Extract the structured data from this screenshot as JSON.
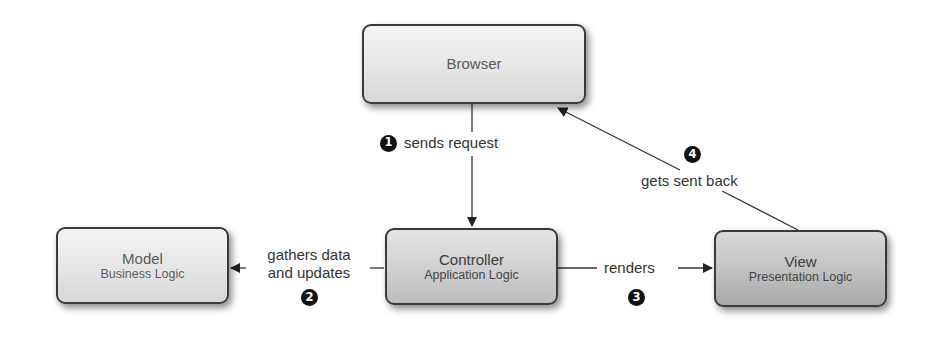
{
  "diagram": {
    "colors": {
      "background": "#ffffff",
      "node_border": "#3a3a3a",
      "edge": "#333333",
      "badge": "#111111",
      "text": "#333333"
    },
    "nodes": {
      "browser": {
        "title": "Browser",
        "subtitle": ""
      },
      "model": {
        "title": "Model",
        "subtitle": "Business Logic"
      },
      "controller": {
        "title": "Controller",
        "subtitle": "Application Logic"
      },
      "view": {
        "title": "View",
        "subtitle": "Presentation Logic"
      }
    },
    "edges": [
      {
        "step": "1",
        "from": "Browser",
        "to": "Controller",
        "label": "sends request"
      },
      {
        "step": "2",
        "from": "Controller",
        "to": "Model",
        "label_line1": "gathers data",
        "label_line2": "and updates"
      },
      {
        "step": "3",
        "from": "Controller",
        "to": "View",
        "label": "renders"
      },
      {
        "step": "4",
        "from": "View",
        "to": "Browser",
        "label": "gets sent back"
      }
    ]
  }
}
